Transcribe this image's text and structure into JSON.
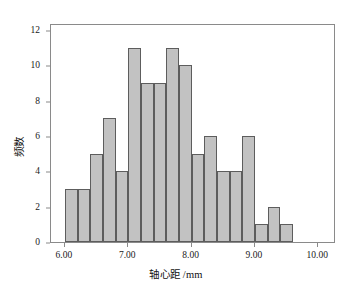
{
  "chart_data": {
    "type": "bar",
    "title": "",
    "subtitle": "",
    "xlabel": "轴心距 /mm",
    "ylabel": "频数",
    "xlim": [
      5.78,
      10.28
    ],
    "ylim": [
      0,
      12.4
    ],
    "grid": false,
    "legend": null,
    "bin_width": 0.2,
    "bin_starts": [
      6.0,
      6.2,
      6.4,
      6.6,
      6.8,
      7.0,
      7.2,
      7.4,
      7.6,
      7.8,
      8.0,
      8.2,
      8.4,
      8.6,
      8.8,
      9.0,
      9.2,
      9.4
    ],
    "categories": [
      "6.0-6.2",
      "6.2-6.4",
      "6.4-6.6",
      "6.6-6.8",
      "6.8-7.0",
      "7.0-7.2",
      "7.2-7.4",
      "7.4-7.6",
      "7.6-7.8",
      "7.8-8.0",
      "8.0-8.2",
      "8.2-8.4",
      "8.4-8.6",
      "8.6-8.8",
      "8.8-9.0",
      "9.0-9.2",
      "9.2-9.4",
      "9.4-9.6"
    ],
    "values": [
      3,
      3,
      5,
      7,
      4,
      11,
      9,
      9,
      11,
      10,
      5,
      6,
      4,
      4,
      6,
      1,
      2,
      1
    ],
    "total": 100,
    "xticks": [
      6.0,
      7.0,
      8.0,
      9.0,
      10.0
    ],
    "xticklabels": [
      "6.00",
      "7.00",
      "8.00",
      "9.00",
      "10.00"
    ],
    "yticks": [
      0,
      2,
      4,
      6,
      8,
      10,
      12
    ],
    "yticklabels": [
      "0",
      "2",
      "4",
      "6",
      "8",
      "10",
      "12"
    ],
    "bar_fill_color": "#c2c2c2",
    "bar_edge_color": "#5d5d5d",
    "frame_color": "#8a8a8a",
    "text_color": "#1a1a1a",
    "background_color": "#ffffff"
  }
}
